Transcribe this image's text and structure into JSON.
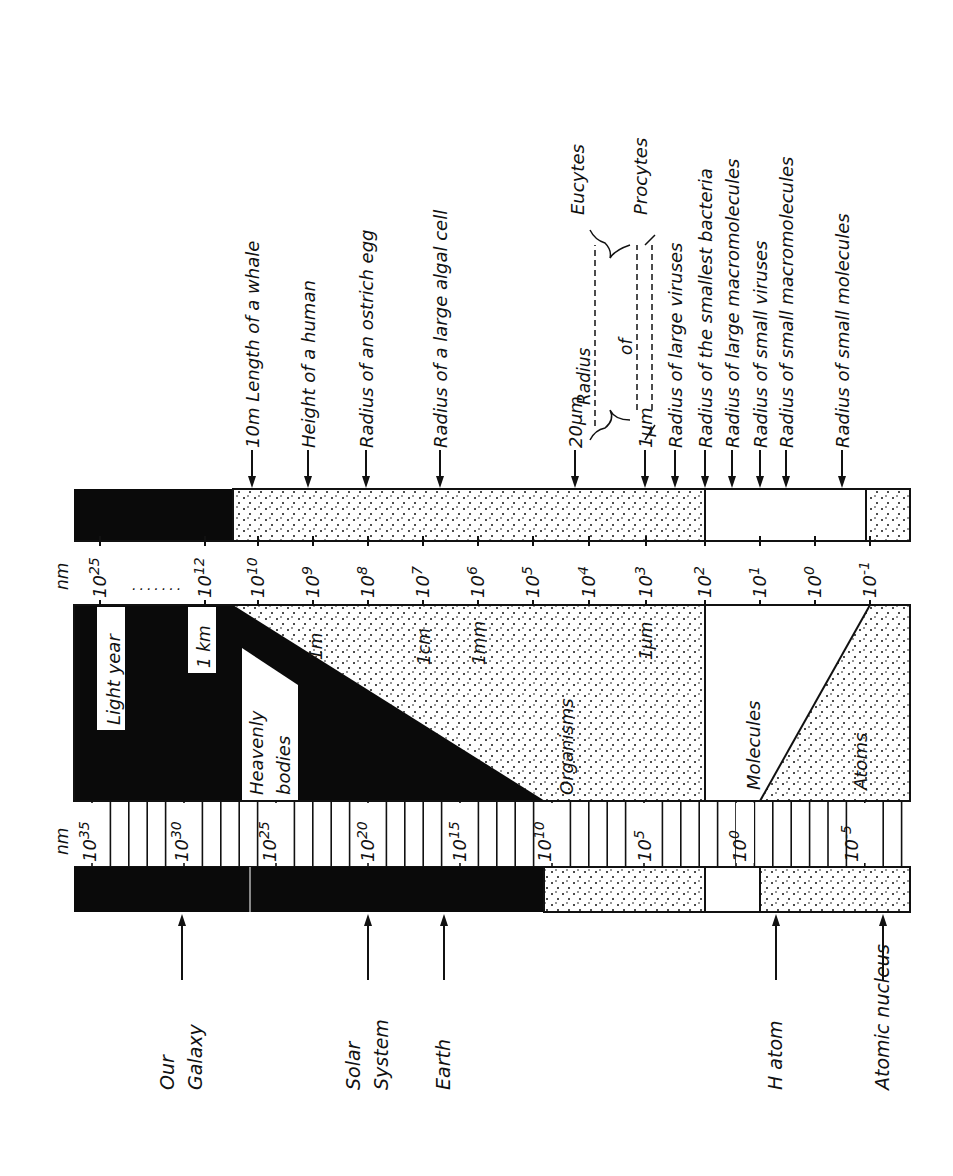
{
  "unit_label": "nm",
  "colors": {
    "ink": "#0a0a0a",
    "paper": "#ffffff"
  },
  "top_labels": [
    {
      "x": 252,
      "text": "10m Length of a whale"
    },
    {
      "x": 308,
      "text": "Height of a human"
    },
    {
      "x": 366,
      "text": "Radius of an ostrich egg"
    },
    {
      "x": 440,
      "text": "Radius of a large algal cell"
    },
    {
      "x": 575,
      "text": "20μm"
    },
    {
      "x": 645,
      "text": "1μm"
    },
    {
      "x": 675,
      "text": "Radius of large viruses"
    },
    {
      "x": 705,
      "text": "Radius of the smallest bacteria"
    },
    {
      "x": 732,
      "text": "Radius of large macromolecules"
    },
    {
      "x": 760,
      "text": "Radius of small viruses"
    },
    {
      "x": 786,
      "text": "Radius of small macromolecules"
    },
    {
      "x": 842,
      "text": "Radius of small molecules"
    }
  ],
  "bracket": {
    "radius": "Radius",
    "of": "of",
    "eucytes": "Eucytes",
    "procytes": "Procytes"
  },
  "upper_ticks": [
    {
      "x": 100,
      "base": "10",
      "exp": "25"
    },
    {
      "x": 205,
      "base": "10",
      "exp": "12"
    },
    {
      "x": 258,
      "base": "10",
      "exp": "10"
    },
    {
      "x": 313,
      "base": "10",
      "exp": "9"
    },
    {
      "x": 368,
      "base": "10",
      "exp": "8"
    },
    {
      "x": 423,
      "base": "10",
      "exp": "7"
    },
    {
      "x": 478,
      "base": "10",
      "exp": "6"
    },
    {
      "x": 533,
      "base": "10",
      "exp": "5"
    },
    {
      "x": 589,
      "base": "10",
      "exp": "4"
    },
    {
      "x": 646,
      "base": "10",
      "exp": "3"
    },
    {
      "x": 705,
      "base": "10",
      "exp": "2"
    },
    {
      "x": 760,
      "base": "10",
      "exp": "1"
    },
    {
      "x": 815,
      "base": "10",
      "exp": "0"
    },
    {
      "x": 870,
      "base": "10",
      "exp": "-1"
    }
  ],
  "middle_labels": {
    "light_year": "Light year",
    "km": "1 km",
    "heavenly": [
      "Heavenly",
      "bodies"
    ],
    "m": "1m",
    "cm": "1cm",
    "mm": "1mm",
    "um": "1μm",
    "organisms": "Organisms",
    "molecules": "Molecules",
    "atoms": "Atoms"
  },
  "lower_ticks": [
    {
      "x": 90,
      "base": "10",
      "exp": "35"
    },
    {
      "x": 182,
      "base": "10",
      "exp": "30"
    },
    {
      "x": 270,
      "base": "10",
      "exp": "25"
    },
    {
      "x": 368,
      "base": "10",
      "exp": "20"
    },
    {
      "x": 460,
      "base": "10",
      "exp": "15"
    },
    {
      "x": 545,
      "base": "10",
      "exp": "10"
    },
    {
      "x": 645,
      "base": "10",
      "exp": "5"
    },
    {
      "x": 740,
      "base": "10",
      "exp": "0"
    },
    {
      "x": 852,
      "base": "10",
      "exp": "-5"
    }
  ],
  "bottom_labels": [
    {
      "x": 182,
      "lines": [
        "Our",
        "Galaxy"
      ]
    },
    {
      "x": 368,
      "lines": [
        "Solar",
        "System"
      ]
    },
    {
      "x": 444,
      "lines": [
        "Earth"
      ]
    },
    {
      "x": 776,
      "lines": [
        "H atom"
      ]
    },
    {
      "x": 883,
      "lines": [
        "Atomic nucleus"
      ]
    }
  ]
}
